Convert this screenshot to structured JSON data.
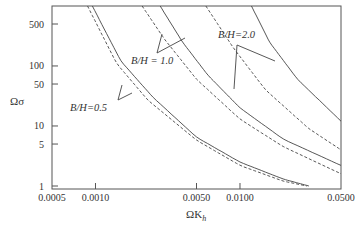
{
  "chart_data": {
    "type": "line",
    "title": "",
    "xlabel": "ΩK_h",
    "ylabel": "Ωσ",
    "xscale": "log",
    "yscale": "log",
    "xlim": [
      0.0005,
      0.05
    ],
    "ylim": [
      1,
      1000
    ],
    "grid": false,
    "x_ticks": [
      "0.0005",
      "0.0010",
      "0.0050",
      "0.0100",
      "0.0500"
    ],
    "x_tick_values": [
      0.0005,
      0.001,
      0.005,
      0.01,
      0.05
    ],
    "y_ticks": [
      "1",
      "5",
      "10",
      "50",
      "100",
      "500"
    ],
    "y_tick_values": [
      1,
      5,
      10,
      50,
      100,
      500
    ],
    "series": [
      {
        "name": "B/H=0.5 (solid)",
        "style": "solid",
        "x": [
          0.00095,
          0.0015,
          0.0025,
          0.005,
          0.01,
          0.02,
          0.03
        ],
        "y": [
          1000,
          120,
          30,
          6.5,
          2.5,
          1.3,
          1.0
        ]
      },
      {
        "name": "B/H=0.5 (dashed)",
        "style": "dashed",
        "x": [
          0.00088,
          0.0014,
          0.0023,
          0.005,
          0.01,
          0.02,
          0.029
        ],
        "y": [
          1000,
          110,
          27,
          5.8,
          2.2,
          1.2,
          1.0
        ]
      },
      {
        "name": "B/H=1.0 (solid)",
        "style": "solid",
        "x": [
          0.0028,
          0.004,
          0.006,
          0.01,
          0.02,
          0.05
        ],
        "y": [
          1000,
          250,
          70,
          20,
          6,
          2.2
        ]
      },
      {
        "name": "B/H=1.0 (dashed)",
        "style": "dashed",
        "x": [
          0.0021,
          0.003,
          0.005,
          0.01,
          0.02,
          0.05
        ],
        "y": [
          1000,
          280,
          60,
          13,
          4.5,
          1.6
        ]
      },
      {
        "name": "B/H=2.0 (solid)",
        "style": "solid",
        "x": [
          0.012,
          0.016,
          0.025,
          0.05
        ],
        "y": [
          1000,
          250,
          60,
          12
        ]
      },
      {
        "name": "B/H=2.0 (dashed)",
        "style": "dashed",
        "x": [
          0.0058,
          0.009,
          0.015,
          0.03,
          0.05
        ],
        "y": [
          1000,
          200,
          40,
          9,
          4.0
        ]
      }
    ],
    "annotations": [
      {
        "text": "B/H=0.5",
        "target": "B/H=0.5 curves"
      },
      {
        "text": "B/H = 1.0",
        "target": "B/H=1.0 curves"
      },
      {
        "text": "B/H=2.0",
        "target": "B/H=2.0 curves"
      }
    ],
    "legend": "none (curves labeled directly with leader lines)"
  },
  "labels": {
    "xlabel_main": "ΩK",
    "xlabel_sub": "h",
    "ylabel": "Ωσ",
    "ann_05": "B/H=0.5",
    "ann_10": "B/H = 1.0",
    "ann_20": "B/H=2.0"
  }
}
